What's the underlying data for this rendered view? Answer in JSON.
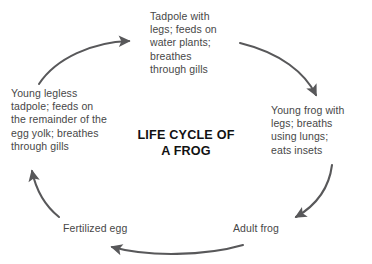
{
  "diagram": {
    "title": "LIFE CYCLE OF\nA FROG",
    "title_plain": "LIFE CYCLE OF A FROG",
    "background_color": "#ffffff",
    "text_color": "#474747",
    "title_color": "#121212",
    "arrow_color": "#58585a",
    "stages": [
      {
        "id": "tadpole-with-legs",
        "label": "Tadpole with\nlegs; feeds on\nwater plants;\nbreathes\nthrough gills",
        "position": "top-center"
      },
      {
        "id": "young-frog",
        "label": "Young frog with\nlegs; breaths\nusing lungs;\neats insets",
        "position": "right"
      },
      {
        "id": "adult-frog",
        "label": "Adult frog",
        "position": "bottom-right"
      },
      {
        "id": "fertilized-egg",
        "label": "Fertilized egg",
        "position": "bottom-left"
      },
      {
        "id": "young-legless-tadpole",
        "label": "Young legless\ntadpole; feeds on\nthe remainder of the\negg yolk; breathes\nthrough gills",
        "position": "left"
      }
    ],
    "arrows": [
      {
        "id": "arrow-legless-tadpole-to-tadpole",
        "from": "young-legless-tadpole",
        "to": "tadpole-with-legs",
        "direction": "up-right"
      },
      {
        "id": "arrow-tadpole-to-young-frog",
        "from": "tadpole-with-legs",
        "to": "young-frog",
        "direction": "down-right"
      },
      {
        "id": "arrow-young-frog-to-adult-frog",
        "from": "young-frog",
        "to": "adult-frog",
        "direction": "down-left"
      },
      {
        "id": "arrow-adult-frog-to-fertilized-egg",
        "from": "adult-frog",
        "to": "fertilized-egg",
        "direction": "left"
      },
      {
        "id": "arrow-fertilized-egg-to-legless-tadpole",
        "from": "fertilized-egg",
        "to": "young-legless-tadpole",
        "direction": "up-left"
      }
    ]
  }
}
